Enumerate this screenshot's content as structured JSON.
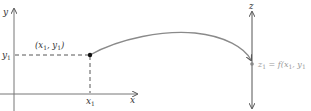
{
  "diagram": {
    "type": "function-mapping",
    "left_plot": {
      "x_axis_label": "x",
      "y_axis_label": "y",
      "point_label": "(x1, y1)",
      "point_label_parts": [
        "(x",
        "1",
        ", y",
        "1",
        ")"
      ],
      "x_tick_label": "x1",
      "x_tick_parts": [
        "x",
        "1"
      ],
      "y_tick_label": "y1",
      "y_tick_parts": [
        "y",
        "1"
      ]
    },
    "right_axis": {
      "z_axis_label": "z",
      "value_label": "z1 = f(x1, y1",
      "value_label_parts": [
        "z",
        "1",
        " = f(x",
        "1",
        ", y",
        "1"
      ]
    },
    "colors": {
      "axes": "#666666",
      "curve": "#8a8a8a",
      "point": "#111111",
      "text": "#333333",
      "value_text": "#9a9a9a"
    }
  }
}
